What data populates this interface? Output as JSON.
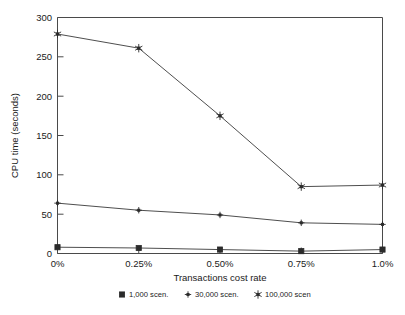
{
  "chart_data": {
    "type": "line",
    "title": "",
    "xlabel": "Transactions cost rate",
    "ylabel": "CPU time (seconds)",
    "categories": [
      "0%",
      "0.25%",
      "0.50%",
      "0.75%",
      "1.0%"
    ],
    "x_tick_labels": [
      "0%",
      "0.25%",
      "0.50%",
      "0.75%",
      "1.0%"
    ],
    "y_tick_labels": [
      "0",
      "50",
      "100",
      "150",
      "200",
      "250",
      "300"
    ],
    "y_ticks": [
      0,
      50,
      100,
      150,
      200,
      250,
      300
    ],
    "ylim": [
      0,
      300
    ],
    "xlim": [
      0,
      4
    ],
    "grid": false,
    "legend_position": "bottom",
    "series": [
      {
        "name": "1,000 scen.",
        "marker": "square",
        "values": [
          8,
          7,
          5,
          3,
          5
        ]
      },
      {
        "name": "30,000 scen.",
        "marker": "plus",
        "values": [
          64,
          55,
          49,
          39,
          37
        ]
      },
      {
        "name": "100,000 scen",
        "marker": "asterisk",
        "values": [
          279,
          261,
          175,
          85,
          87
        ]
      }
    ],
    "colors": {
      "line": "#3a3a3a",
      "marker": "#2b2b2b",
      "frame": "#4a4a4a",
      "text": "#1a1a1a",
      "background": "#ffffff"
    }
  },
  "legend": {
    "entries": [
      {
        "marker_name": "square-marker-icon",
        "label": "1,000 scen."
      },
      {
        "marker_name": "plus-marker-icon",
        "label": "30,000 scen."
      },
      {
        "marker_name": "asterisk-marker-icon",
        "label": "100,000 scen"
      }
    ]
  },
  "axes": {
    "y_title": "CPU time (seconds)",
    "x_title": "Transactions cost rate",
    "y_labels": {
      "t0": "0",
      "t50": "50",
      "t100": "100",
      "t150": "150",
      "t200": "200",
      "t250": "250",
      "t300": "300"
    },
    "x_labels": {
      "t0": "0%",
      "t1": "0.25%",
      "t2": "0.50%",
      "t3": "0.75%",
      "t4": "1.0%"
    }
  }
}
